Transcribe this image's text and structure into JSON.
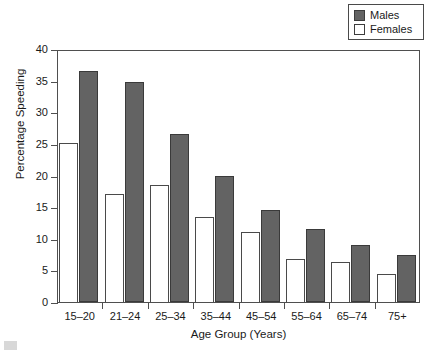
{
  "chart_data": {
    "type": "bar",
    "title": "",
    "xlabel": "Age Group (Years)",
    "ylabel": "Percentage Speeding",
    "categories": [
      "15–20",
      "21–24",
      "25–34",
      "35–44",
      "45–54",
      "55–64",
      "65–74",
      "75+"
    ],
    "series": [
      {
        "name": "Males",
        "color": "#636363",
        "values": [
          36.5,
          34.8,
          26.6,
          20.0,
          14.6,
          11.6,
          9.0,
          7.5
        ]
      },
      {
        "name": "Females",
        "color": "#ffffff",
        "values": [
          25.2,
          17.1,
          18.5,
          13.5,
          11.1,
          6.8,
          6.4,
          4.5
        ]
      }
    ],
    "ylim": [
      0,
      40
    ],
    "yticks": [
      0,
      5,
      10,
      15,
      20,
      25,
      30,
      35,
      40
    ],
    "ytick_labels": [
      "0",
      "5",
      "10",
      "15",
      "20",
      "25",
      "30",
      "35",
      "40"
    ],
    "grid": false,
    "legend_position": "top-right"
  },
  "legend": {
    "entries": [
      {
        "label": "Males",
        "swatch": "filled-dark-square"
      },
      {
        "label": "Females",
        "swatch": "open-white-square"
      }
    ]
  }
}
